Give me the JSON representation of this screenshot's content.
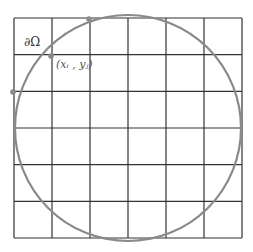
{
  "diagram": {
    "boundary_label": "∂Ω",
    "point_label": "(xᵢ , yⱼ)",
    "grid": {
      "x0": 14,
      "y0": 18,
      "x1": 242,
      "y1": 238,
      "cols": 6,
      "rows": 6,
      "line_color": "#333333"
    },
    "circle": {
      "cx": 128,
      "cy": 128,
      "r": 113,
      "color": "#8a8a8a"
    },
    "points": [
      {
        "x": 89,
        "y": 19
      },
      {
        "x": 51,
        "y": 56
      },
      {
        "x": 13,
        "y": 92
      }
    ],
    "point_color": "#8a8a8a"
  }
}
